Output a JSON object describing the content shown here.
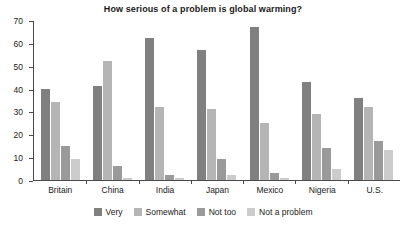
{
  "chart_data": {
    "type": "bar",
    "title": "How serious of a problem is global warming?",
    "xlabel": "",
    "ylabel": "",
    "ylim": [
      0,
      70
    ],
    "yticks": [
      0,
      10,
      20,
      30,
      40,
      50,
      60,
      70
    ],
    "grid": false,
    "legend_position": "bottom",
    "categories": [
      "Britain",
      "China",
      "India",
      "Japan",
      "Mexico",
      "Nigeria",
      "U.S."
    ],
    "series": [
      {
        "name": "Very",
        "color": "#808080",
        "values": [
          40,
          41,
          62,
          57,
          67,
          43,
          36
        ]
      },
      {
        "name": "Somewhat",
        "color": "#b5b5b5",
        "values": [
          34,
          52,
          32,
          31,
          25,
          29,
          32
        ]
      },
      {
        "name": "Not too",
        "color": "#9a9a9a",
        "values": [
          15,
          6,
          2,
          9,
          3,
          14,
          17
        ]
      },
      {
        "name": "Not a problem",
        "color": "#cccccc",
        "values": [
          9,
          1,
          1,
          2,
          1,
          5,
          13
        ]
      }
    ]
  },
  "axis": {
    "tick_labels": [
      "70",
      "60",
      "50",
      "40",
      "30",
      "20",
      "10",
      "0"
    ]
  }
}
